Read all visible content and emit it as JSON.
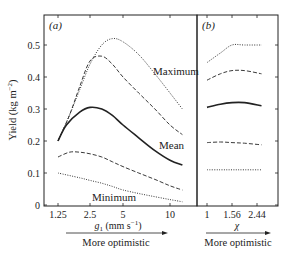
{
  "chart_data": [
    {
      "panel": "(a)",
      "type": "line",
      "xscale": "log",
      "xlabel": "g_1 (mm s^-1)",
      "xlabel_main": "g",
      "xlabel_sub": "1",
      "xlabel_units": " (mm s",
      "xlabel_units_sup": "-1",
      "xlabel_units_end": ")",
      "ylabel": "Yield (kg m^-2)",
      "ylim": [
        0,
        0.55
      ],
      "yticks": [
        0,
        0.1,
        0.2,
        0.3,
        0.4,
        0.5
      ],
      "ytick_labels": [
        "0",
        "0.1",
        "0.2",
        "0.3",
        "0.4",
        "0.5"
      ],
      "xticks": [
        1.25,
        2.5,
        5,
        10
      ],
      "xtick_labels": [
        "1.25",
        "2.5",
        "5",
        "10"
      ],
      "arrow_label": "More optimistic",
      "series": [
        {
          "name": "Maximum",
          "style": "dotted",
          "x": [
            1.25,
            1.6,
            2.0,
            2.5,
            3.2,
            4.0,
            5.0,
            6.3,
            8.0,
            10.0,
            12.0
          ],
          "values": [
            0.2,
            0.28,
            0.36,
            0.44,
            0.5,
            0.52,
            0.51,
            0.47,
            0.41,
            0.35,
            0.3
          ]
        },
        {
          "name": "Upper",
          "style": "dashed",
          "x": [
            1.25,
            1.6,
            2.0,
            2.5,
            3.2,
            4.0,
            5.0,
            6.3,
            8.0,
            10.0,
            12.0
          ],
          "values": [
            0.2,
            0.28,
            0.37,
            0.45,
            0.465,
            0.44,
            0.4,
            0.35,
            0.3,
            0.25,
            0.22
          ]
        },
        {
          "name": "Mean",
          "style": "solid",
          "x": [
            1.25,
            1.5,
            2.0,
            2.5,
            3.2,
            4.0,
            5.0,
            6.3,
            8.0,
            10.0,
            12.0
          ],
          "values": [
            0.2,
            0.25,
            0.29,
            0.305,
            0.3,
            0.28,
            0.25,
            0.21,
            0.17,
            0.14,
            0.125
          ]
        },
        {
          "name": "Lower",
          "style": "dashed",
          "x": [
            1.25,
            1.6,
            2.0,
            2.5,
            3.2,
            4.0,
            5.0,
            6.3,
            8.0,
            10.0,
            12.0
          ],
          "values": [
            0.15,
            0.165,
            0.165,
            0.16,
            0.15,
            0.135,
            0.12,
            0.1,
            0.08,
            0.06,
            0.047
          ]
        },
        {
          "name": "Minimum",
          "style": "dotted",
          "x": [
            1.25,
            2.0,
            2.5,
            3.2,
            4.0,
            5.0,
            6.3,
            8.0,
            10.0,
            12.0
          ],
          "values": [
            0.1,
            0.085,
            0.077,
            0.068,
            0.058,
            0.047,
            0.036,
            0.026,
            0.017,
            0.01
          ]
        }
      ],
      "annotations": [
        {
          "text": "Maximum",
          "near": "Maximum"
        },
        {
          "text": "Mean",
          "near": "Mean"
        },
        {
          "text": "Minimum",
          "near": "Minimum"
        }
      ]
    },
    {
      "panel": "(b)",
      "type": "line",
      "xlabel": "χ",
      "xticks": [
        1,
        1.56,
        2.44
      ],
      "xtick_labels": [
        "1",
        "1.56",
        "2.44"
      ],
      "ylim": [
        0,
        0.55
      ],
      "arrow_label": "More optimistic",
      "series": [
        {
          "name": "Maximum",
          "style": "dotted",
          "values": [
            0.445,
            0.475,
            0.5,
            0.5,
            0.5
          ]
        },
        {
          "name": "Upper",
          "style": "dashed",
          "values": [
            0.39,
            0.41,
            0.42,
            0.42,
            0.41
          ]
        },
        {
          "name": "Mean",
          "style": "solid",
          "values": [
            0.305,
            0.315,
            0.32,
            0.32,
            0.31
          ]
        },
        {
          "name": "Lower",
          "style": "dashed",
          "values": [
            0.195,
            0.197,
            0.195,
            0.193,
            0.188
          ]
        },
        {
          "name": "Minimum",
          "style": "dotted",
          "values": [
            0.11,
            0.11,
            0.11,
            0.11,
            0.11
          ]
        }
      ],
      "x": [
        1,
        1.3,
        1.56,
        2.0,
        2.6
      ]
    }
  ],
  "labels": {
    "panel_a": "(a)",
    "panel_b": "(b)",
    "ylabel": "Yield (kg m",
    "ylabel_sup": "−2",
    "ylabel_end": ")",
    "xlabel_a_g": "g",
    "xlabel_a_sub": "1",
    "xlabel_a_units": " (mm s",
    "xlabel_a_sup": "−1",
    "xlabel_a_end": ")",
    "xlabel_b": "χ",
    "arrow_a": "More optimistic",
    "arrow_b": "More optimistic",
    "ann_max": "Maximum",
    "ann_mean": "Mean",
    "ann_min": "Minimum"
  }
}
